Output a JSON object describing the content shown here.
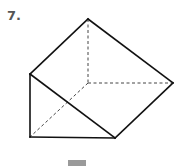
{
  "problem": {
    "number_label": "7."
  },
  "figure": {
    "shape": "triangular-prism",
    "stroke_color": "#111111",
    "hidden_stroke_color": "#444444",
    "vertices": {
      "top": [
        88,
        19
      ],
      "left_upper": [
        30,
        74
      ],
      "right": [
        173,
        83
      ],
      "back_hidden": [
        88,
        83
      ],
      "bottom_left": [
        30,
        137
      ],
      "bottom_right": [
        115,
        138
      ]
    },
    "solid_edges": [
      [
        "top",
        "left_upper"
      ],
      [
        "top",
        "right"
      ],
      [
        "left_upper",
        "bottom_left"
      ],
      [
        "left_upper",
        "bottom_right"
      ],
      [
        "bottom_left",
        "bottom_right"
      ],
      [
        "bottom_right",
        "right"
      ]
    ],
    "dashed_edges": [
      [
        "top",
        "back_hidden"
      ],
      [
        "back_hidden",
        "right"
      ],
      [
        "back_hidden",
        "bottom_left"
      ]
    ]
  },
  "answer_box": {
    "color": "#9a9a9a"
  }
}
